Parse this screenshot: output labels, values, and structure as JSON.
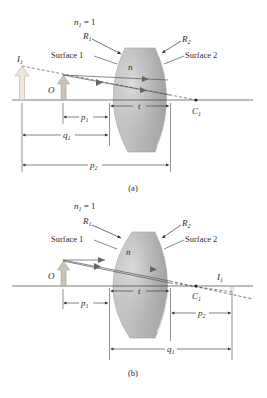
{
  "figure": {
    "panels": [
      {
        "id": "a",
        "caption": "(a)",
        "medium_label": "n",
        "surrounding_index": {
          "symbol": "n",
          "sub": "1",
          "rest": " = 1"
        },
        "radius_labels": [
          {
            "symbol": "R",
            "sub": "1"
          },
          {
            "symbol": "R",
            "sub": "2"
          }
        ],
        "surface_labels": [
          "Surface 1",
          "Surface 2"
        ],
        "object_label": "O",
        "image_label": {
          "symbol": "I",
          "sub": "1"
        },
        "center_label": {
          "symbol": "C",
          "sub": "1"
        },
        "dimensions": [
          {
            "symbol": "p",
            "sub": "1"
          },
          {
            "symbol": "q",
            "sub": "1"
          },
          {
            "symbol": "p",
            "sub": "2"
          },
          {
            "symbol": "t",
            "sub": ""
          }
        ]
      },
      {
        "id": "b",
        "caption": "(b)",
        "medium_label": "n",
        "surrounding_index": {
          "symbol": "n",
          "sub": "1",
          "rest": " = 1"
        },
        "radius_labels": [
          {
            "symbol": "R",
            "sub": "1"
          },
          {
            "symbol": "R",
            "sub": "2"
          }
        ],
        "surface_labels": [
          "Surface 1",
          "Surface 2"
        ],
        "object_label": "O",
        "image_label": {
          "symbol": "I",
          "sub": "1"
        },
        "center_label": {
          "symbol": "C",
          "sub": "1"
        },
        "dimensions": [
          {
            "symbol": "p",
            "sub": "1"
          },
          {
            "symbol": "t",
            "sub": ""
          },
          {
            "symbol": "p",
            "sub": "2"
          },
          {
            "symbol": "q",
            "sub": "1"
          }
        ]
      }
    ],
    "colors": {
      "lens_fill": "#b4b4b6",
      "lens_light": "#d4d4d6",
      "lens_dark": "#9a9a9c",
      "arrow_fill": "#c9c2b8",
      "image_arrow_fill": "#ece4da",
      "line": "#3a3a3a",
      "text": "#2b2b2b"
    }
  }
}
